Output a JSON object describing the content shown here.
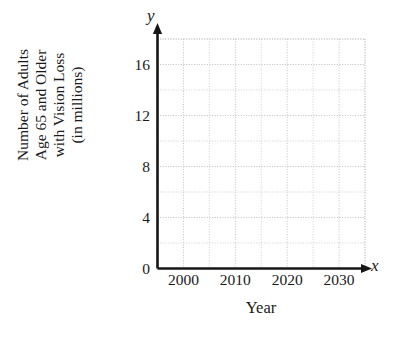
{
  "chart_data": {
    "type": "scatter",
    "title": "",
    "subtitle": "",
    "xlabel": "Year",
    "ylabel": "Number of Adults Age 65 and Older with Vision Loss (in millions)",
    "ylabel_lines": [
      "Number of Adults",
      "Age 65 and Older",
      "with Vision Loss",
      "(in millions)"
    ],
    "x_axis_letter": "x",
    "y_axis_letter": "y",
    "x_tick_labels": [
      "2000",
      "2010",
      "2020",
      "2030"
    ],
    "x_tick_values": [
      2000,
      2010,
      2020,
      2030
    ],
    "y_tick_labels": [
      "0",
      "4",
      "8",
      "12",
      "16"
    ],
    "y_tick_values": [
      0,
      4,
      8,
      12,
      16
    ],
    "xlim": [
      1995,
      2035
    ],
    "ylim": [
      0,
      18
    ],
    "x_minor_step": 5,
    "y_minor_step": 2,
    "grid": true,
    "grid_style": "dotted",
    "grid_color": "#bdbdbd",
    "axis_color": "#161616",
    "legend": null,
    "legend_position": "none",
    "series": [],
    "values": [],
    "categories": [],
    "annotations": [],
    "note": "Empty coordinate grid — no data plotted"
  },
  "colors": {
    "background": "#ffffff",
    "axis": "#161616",
    "grid": "#bdbdbd",
    "text": "#1a1a1a"
  }
}
